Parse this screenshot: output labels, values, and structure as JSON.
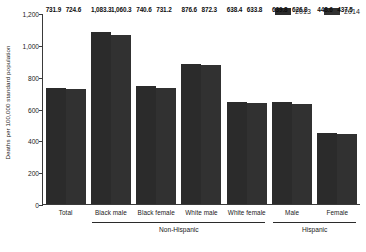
{
  "chart_data": {
    "type": "bar",
    "title": "",
    "xlabel": "",
    "ylabel": "Deaths per 100,000 standard population",
    "ylim": [
      0,
      1200
    ],
    "ytick_labels": [
      "1,200",
      "1,000",
      "800",
      "600",
      "400",
      "200",
      "0"
    ],
    "ytick_values": [
      1200,
      1000,
      800,
      600,
      400,
      200,
      0
    ],
    "grid": false,
    "legend_position": "top-right",
    "categories": [
      "Total",
      "Black male",
      "Black female",
      "White male",
      "White female",
      "Male",
      "Female"
    ],
    "series": [
      {
        "name": "2013",
        "color": "#2b2b2b",
        "values": [
          731.9,
          1083.3,
          740.6,
          876.6,
          638.4,
          639.8,
          448.6
        ],
        "value_labels": [
          "731.9",
          "1,083.3",
          "740.6",
          "876.6",
          "638.4",
          "639.8",
          "448.6"
        ]
      },
      {
        "name": "2014",
        "color": "#313131",
        "values": [
          724.6,
          1060.3,
          731.2,
          872.3,
          633.8,
          626.8,
          437.5
        ],
        "value_labels": [
          "724.6",
          "1,060.3",
          "731.2",
          "872.3",
          "633.8",
          "626.8",
          "437.5"
        ]
      }
    ],
    "group_brackets": [
      {
        "label": "Non-Hispanic",
        "start_category": 1,
        "end_category": 4
      },
      {
        "label": "Hispanic",
        "start_category": 5,
        "end_category": 6
      }
    ]
  },
  "legend": {
    "entries": [
      {
        "label": "2013",
        "color": "#2b2b2b"
      },
      {
        "label": "2014",
        "color": "#313131"
      }
    ]
  },
  "axis": {
    "y_title": "Deaths per 100,000 standard population"
  }
}
